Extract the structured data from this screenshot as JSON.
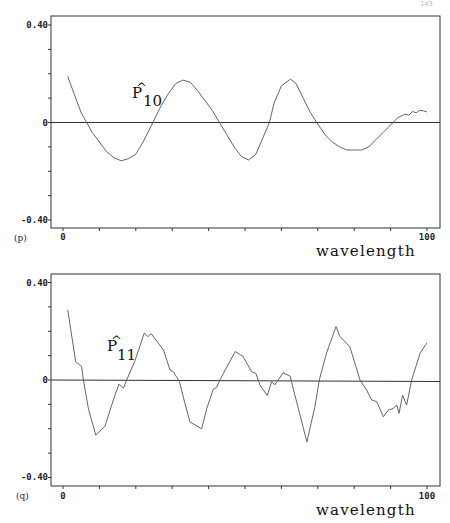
{
  "page_number": "143",
  "chart_data": [
    {
      "type": "line",
      "panel_label": "(p)",
      "annotation": {
        "base": "P",
        "hat": "^",
        "subscript": "10"
      },
      "xlabel": "wavelength",
      "ylabel": "",
      "xlim": [
        0,
        100
      ],
      "ylim": [
        -0.4,
        0.4
      ],
      "x_tick_labels": [
        "0",
        "100"
      ],
      "y_tick_labels": [
        "0.40",
        "0",
        "-0.40"
      ],
      "zero_line": true,
      "grid": false,
      "series": [
        {
          "name": "P10",
          "x": [
            1.3,
            3,
            5,
            6.5,
            8,
            10,
            12,
            14,
            16,
            18,
            20,
            22,
            24.7,
            27,
            29,
            31,
            33,
            35,
            37,
            39,
            41,
            43,
            45,
            47,
            49,
            51,
            53,
            55,
            56.7,
            58,
            60,
            62.5,
            64,
            66,
            68,
            69.7,
            72,
            74,
            76,
            78,
            80,
            82,
            84,
            86,
            88,
            90.7,
            92,
            94,
            95,
            96,
            97,
            98,
            99,
            100
          ],
          "y": [
            0.19,
            0.12,
            0.04,
            0.0,
            -0.04,
            -0.08,
            -0.12,
            -0.145,
            -0.157,
            -0.148,
            -0.13,
            -0.08,
            0.0,
            0.07,
            0.12,
            0.16,
            0.174,
            0.165,
            0.13,
            0.09,
            0.05,
            0.0,
            -0.05,
            -0.1,
            -0.14,
            -0.154,
            -0.13,
            -0.06,
            0.0,
            0.08,
            0.15,
            0.178,
            0.16,
            0.1,
            0.04,
            0.0,
            -0.05,
            -0.08,
            -0.1,
            -0.113,
            -0.113,
            -0.113,
            -0.1,
            -0.07,
            -0.04,
            0.0,
            0.02,
            0.035,
            0.03,
            0.045,
            0.04,
            0.05,
            0.048,
            0.043
          ]
        }
      ]
    },
    {
      "type": "line",
      "panel_label": "(q)",
      "annotation": {
        "base": "P",
        "hat": "^",
        "subscript": "11"
      },
      "xlabel": "wavelength",
      "ylabel": "",
      "xlim": [
        0,
        100
      ],
      "ylim": [
        -0.4,
        0.4
      ],
      "x_tick_labels": [
        "0",
        "100"
      ],
      "y_tick_labels": [
        "0.40",
        "0",
        "-0.40"
      ],
      "zero_line": true,
      "grid": false,
      "series": [
        {
          "name": "P11",
          "x": [
            1.3,
            3.5,
            5.1,
            5.6,
            7,
            9,
            11.5,
            14.1,
            15.4,
            16.6,
            17.5,
            19.8,
            22.3,
            23.3,
            24.2,
            27.6,
            29.4,
            30.3,
            32,
            33.5,
            34.9,
            38.1,
            39.5,
            41.3,
            42.2,
            43.1,
            47.3,
            49.5,
            51.8,
            53,
            54.1,
            56.1,
            57.3,
            58.2,
            59.1,
            60.5,
            62.4,
            63.7,
            67,
            69.2,
            70.4,
            72.4,
            75,
            76.1,
            78.8,
            80.2,
            81.6,
            83.4,
            84.8,
            86.2,
            88,
            89.4,
            90.7,
            91.7,
            92.3,
            93.3,
            94.4,
            95.8,
            98.1,
            100
          ],
          "y": [
            0.288,
            0.075,
            0.055,
            0.0,
            -0.12,
            -0.226,
            -0.19,
            -0.07,
            -0.016,
            -0.034,
            0.0,
            0.08,
            0.192,
            0.178,
            0.19,
            0.123,
            0.041,
            0.034,
            -0.007,
            -0.096,
            -0.172,
            -0.2,
            -0.117,
            -0.038,
            -0.03,
            0.0,
            0.117,
            0.096,
            0.034,
            0.027,
            -0.02,
            -0.064,
            -0.007,
            -0.02,
            0.0,
            0.03,
            0.016,
            -0.062,
            -0.254,
            -0.11,
            0.0,
            0.11,
            0.219,
            0.178,
            0.137,
            0.069,
            0.0,
            -0.041,
            -0.082,
            -0.089,
            -0.151,
            -0.123,
            -0.117,
            -0.103,
            -0.137,
            -0.062,
            -0.103,
            0.0,
            0.11,
            0.153
          ]
        }
      ]
    }
  ]
}
